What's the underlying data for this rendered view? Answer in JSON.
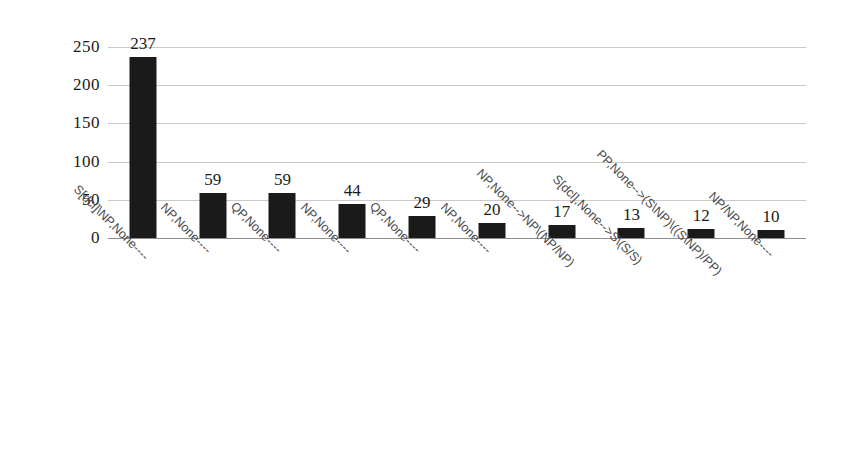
{
  "chart_data": {
    "type": "bar",
    "title": "",
    "subtitle": "",
    "xlabel": "",
    "ylabel": "",
    "ylim": [
      0,
      250
    ],
    "yticks": [
      0,
      50,
      100,
      150,
      200,
      250
    ],
    "ytick_labels": [
      "0",
      "50",
      "100",
      "150",
      "200",
      "250"
    ],
    "grid": true,
    "legend": false,
    "legend_position": "none",
    "bar_color": "#1a1a1a",
    "gridline_color": "#c9c9c9",
    "axis_color": "#8e8e8e",
    "label_color": "#4a4a4a",
    "x_label_rotation_deg": 45,
    "categories": [
      "S[dcl]\\NP,None----",
      "NP,None----",
      "QP,None----",
      "NP,None----",
      "QP,None----",
      "NP,None----",
      "NP,None-->NP\\(NP/NP)",
      "S[dcl],None-->S\\(S/S)",
      "PP,None-->(S\\NP)\\((S\\NP)/PP)",
      "NP/NP,None----"
    ],
    "values": [
      237,
      59,
      59,
      44,
      29,
      20,
      17,
      13,
      12,
      10
    ],
    "value_labels": [
      "237",
      "59",
      "59",
      "44",
      "29",
      "20",
      "17",
      "13",
      "12",
      "10"
    ]
  }
}
